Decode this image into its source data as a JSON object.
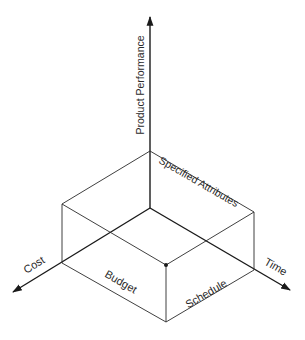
{
  "diagram": {
    "type": "3d-axes-box",
    "axes": {
      "vertical": {
        "label": "Product Performance"
      },
      "left": {
        "label": "Cost"
      },
      "right": {
        "label": "Time"
      }
    },
    "faces": {
      "top": {
        "label": "Specified Attributes"
      },
      "front_left": {
        "label": "Budget"
      },
      "front_right": {
        "label": "Schedule"
      }
    },
    "colors": {
      "line": "#1a1a1a",
      "text": "#2a2a2a",
      "background": "#ffffff"
    }
  }
}
